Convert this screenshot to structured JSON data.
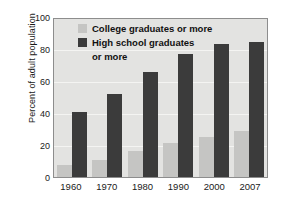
{
  "chart_data": {
    "type": "bar",
    "title": "",
    "xlabel": "",
    "ylabel": "Percent of adult population",
    "categories": [
      "1960",
      "1970",
      "1980",
      "1990",
      "2000",
      "2007"
    ],
    "ylim": [
      0,
      100
    ],
    "yticks": [
      "100",
      "80",
      "60",
      "40",
      "20",
      "0"
    ],
    "ytick_values": [
      100,
      80,
      60,
      40,
      20,
      0
    ],
    "grid": true,
    "legend_position": "top-center-inside",
    "series": [
      {
        "name": "College graduates or more",
        "color": "#c5c5c3",
        "values": [
          7.7,
          10.7,
          16.2,
          21.3,
          25.6,
          29.4
        ]
      },
      {
        "name": "High school graduates or more",
        "color": "#3b3b3b",
        "values": [
          41.1,
          52.3,
          66.5,
          77.6,
          84.1,
          85.7
        ]
      }
    ]
  },
  "legend": {
    "item1_label": "College graduates or more",
    "item2_label_line1": "High school graduates",
    "item2_label_line2": "or more"
  },
  "colors": {
    "light_bar": "#c5c5c3",
    "dark_bar": "#3b3b3b",
    "plot_background": "#e3e3e1",
    "gridline": "#f4f4f2",
    "axis_frame": "#8d8d8d",
    "text": "#1a1a1a"
  }
}
